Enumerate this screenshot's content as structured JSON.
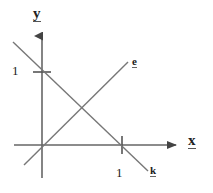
{
  "figure": {
    "type": "line-diagram",
    "background_color": "#ffffff",
    "stroke_color": "#555555",
    "text_color": "#222222"
  },
  "axes": {
    "y_label": "y",
    "x_label": "x",
    "origin": {
      "x": 42,
      "y": 145
    },
    "y_axis": {
      "from_y": 178,
      "to_y": 33,
      "arrow": "up"
    },
    "x_axis": {
      "from_x": 14,
      "to_x": 180,
      "arrow": "right"
    }
  },
  "ticks": {
    "y": {
      "label": "1",
      "pixel_y": 72,
      "mark_half_width": 9
    },
    "x": {
      "label": "1",
      "pixel_x": 122,
      "mark_half_height": 9
    }
  },
  "lines": [
    {
      "name": "e",
      "label": "e",
      "direction": "upward-sloping",
      "passes_through_origin": true,
      "start": {
        "x": 24,
        "y": 165
      },
      "end": {
        "x": 128,
        "y": 62
      }
    },
    {
      "name": "k",
      "label": "k",
      "direction": "downward-sloping",
      "intercepts": {
        "y_at": 1,
        "x_at": 1
      },
      "start": {
        "x": 13,
        "y": 42
      },
      "end": {
        "x": 148,
        "y": 171
      }
    }
  ],
  "annotations": {
    "intersection_note": "lines e and k cross between the axes"
  }
}
